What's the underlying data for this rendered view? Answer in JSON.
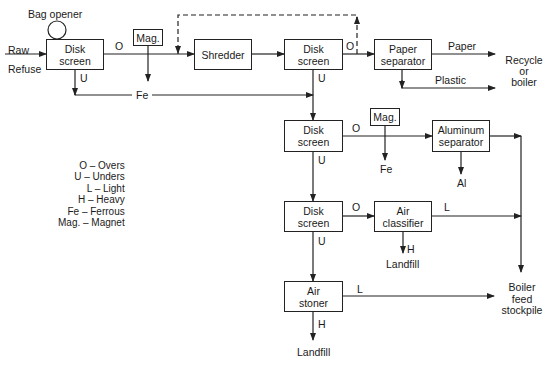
{
  "diagram": {
    "type": "process flow diagram",
    "nodes": {
      "bag_opener": "Bag opener",
      "input": "Raw\nRefuse",
      "disk1": "Disk\nscreen",
      "mag1": "Mag.",
      "shredder": "Shredder",
      "disk2": "Disk\nscreen",
      "paper_sep": "Paper\nseparator",
      "disk3": "Disk\nscreen",
      "mag2": "Mag.",
      "al_sep": "Aluminum\nseparator",
      "disk4": "Disk\nscreen",
      "air_classifier": "Air\nclassifier",
      "air_stoner": "Air\nstoner"
    },
    "outputs": {
      "recycle": "Recycle\nor\nboiler",
      "boiler_feed": "Boiler\nfeed\nstockpile",
      "landfill1": "Landfill",
      "landfill2": "Landfill",
      "fe2": "Fe",
      "al": "Al"
    },
    "edge_labels": {
      "o1": "O",
      "u1": "U",
      "fe1": "Fe",
      "o2": "O",
      "u2": "U",
      "paper": "Paper",
      "plastic": "Plastic",
      "o3": "O",
      "u3": "U",
      "o4": "O",
      "u4": "U",
      "l_classifier": "L",
      "h_classifier": "H",
      "l_stoner": "L",
      "h_stoner": "H"
    },
    "legend": [
      "O – Overs",
      "U – Unders",
      "L – Light",
      "H – Heavy",
      "Fe – Ferrous",
      "Mag. – Magnet"
    ]
  }
}
